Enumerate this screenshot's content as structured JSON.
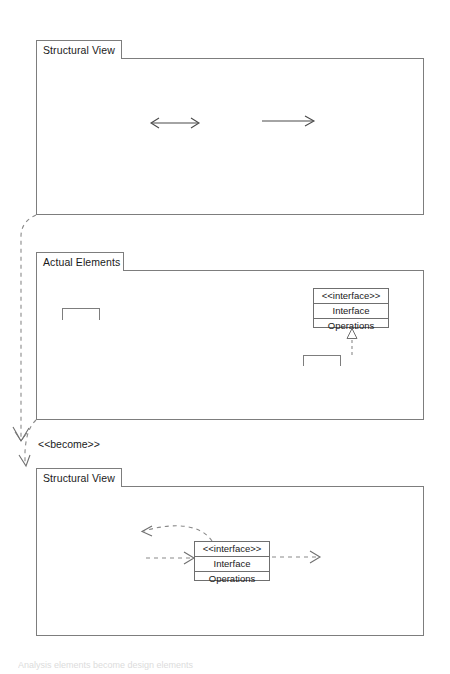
{
  "diagram": {
    "title": "Analysis elements become design elements",
    "frames": [
      {
        "id": "analysis-structural-view",
        "tab_label": "Structural View"
      },
      {
        "id": "actual-elements",
        "tab_label": "Actual Elements"
      },
      {
        "id": "design-structural-view",
        "tab_label": "Structural View"
      }
    ],
    "analysis_elements": [
      {
        "stereotype_icon": "boundary-icon",
        "name": "Boundary",
        "attributes_label": "Attributes",
        "operations_label": "Operations"
      },
      {
        "stereotype_icon": "control-icon",
        "name": "Control",
        "attributes_label": "Attributes",
        "operations_label": "Operations"
      },
      {
        "stereotype_icon": "entity-icon",
        "name": "Entity",
        "attributes_label": "Attributes",
        "operations_label": "Operations"
      }
    ],
    "actual_elements": {
      "package": {
        "label": "Package"
      },
      "class": {
        "label": "Class"
      },
      "interface": {
        "stereotype": "<<interface>>",
        "name": "Interface",
        "operations_label": "Operations"
      },
      "subsystem": {
        "stereotype": "<<subsystem>>",
        "name": "Subsystem"
      }
    },
    "design_elements": [
      {
        "stereotype_icon": "boundary-icon",
        "name": "Boundary",
        "attributes_label": "Attributes",
        "operations_label": "Operations"
      },
      {
        "stereotype_icon": "entity-icon",
        "name": "Entity",
        "attributes_label": "Attributes",
        "operations_label": "Operations"
      }
    ],
    "design_interface": {
      "stereotype": "<<interface>>",
      "name": "Interface",
      "operations_label": "Operations"
    },
    "dependency_label": "<<become>>",
    "colors": {
      "stroke": "#7d7d7d",
      "dashed_stroke": "#8a8a8a",
      "arrow_stroke": "#4a4a4a",
      "text": "#1a1a1a",
      "background": "#ffffff"
    }
  }
}
